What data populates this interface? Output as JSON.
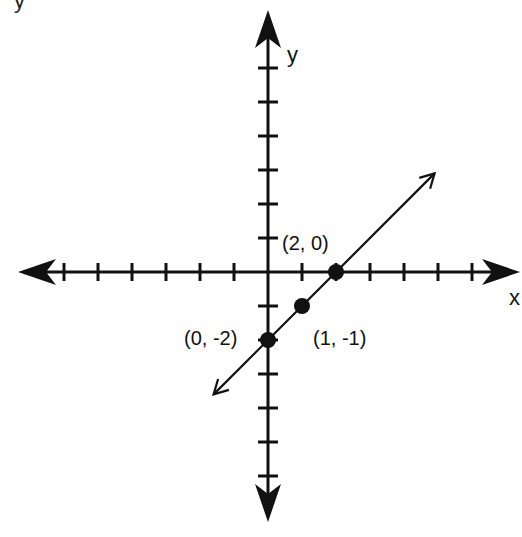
{
  "chart_data": {
    "type": "line",
    "title": "",
    "xlabel": "x",
    "ylabel": "y",
    "xlim": [
      -7,
      7
    ],
    "ylim": [
      -7,
      7
    ],
    "grid": false,
    "legend": null,
    "x_ticks": [
      -6,
      -5,
      -4,
      -3,
      -2,
      -1,
      1,
      2,
      3,
      4,
      5,
      6
    ],
    "y_ticks": [
      -6,
      -5,
      -4,
      -3,
      -2,
      -1,
      1,
      2,
      3,
      4,
      5,
      6
    ],
    "series": [
      {
        "name": "line",
        "equation": "y = x - 2",
        "x": [
          -1.6,
          4.9
        ],
        "y": [
          -3.6,
          2.9
        ],
        "arrows_both_ends": true
      }
    ],
    "points": [
      {
        "x": 2,
        "y": 0,
        "label": "(2, 0)"
      },
      {
        "x": 1,
        "y": -1,
        "label": "(1, -1)"
      },
      {
        "x": 0,
        "y": -2,
        "label": "(0, -2)"
      }
    ]
  },
  "labels": {
    "x_axis": "x",
    "y_axis": "y",
    "point_a": "(2, 0)",
    "point_b": "(1, -1)",
    "point_c": "(0, -2)",
    "top_fragment": "y"
  }
}
